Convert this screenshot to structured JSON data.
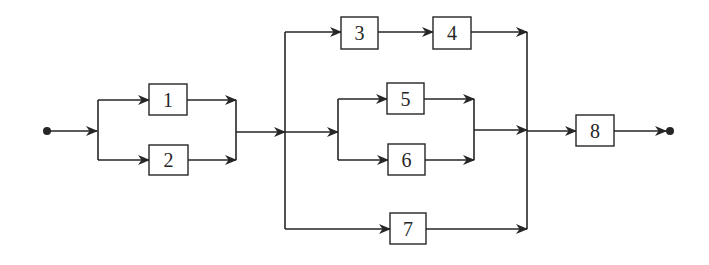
{
  "diagram": {
    "type": "reliability block diagram",
    "blocks": [
      {
        "id": "b1",
        "label": "1"
      },
      {
        "id": "b2",
        "label": "2"
      },
      {
        "id": "b3",
        "label": "3"
      },
      {
        "id": "b4",
        "label": "4"
      },
      {
        "id": "b5",
        "label": "5"
      },
      {
        "id": "b6",
        "label": "6"
      },
      {
        "id": "b7",
        "label": "7"
      },
      {
        "id": "b8",
        "label": "8"
      }
    ],
    "structure": "input -> (1 || 2) -> ((3 -> 4) || (5 || 6) || 7) -> 8 -> output",
    "colors": {
      "stroke": "#262626",
      "background": "#ffffff"
    }
  }
}
